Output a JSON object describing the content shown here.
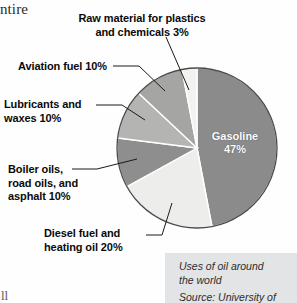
{
  "page": {
    "background": "#fefefe",
    "fragment_top_left": "ntire",
    "fragment_bottom_left": "ll"
  },
  "chart_data": {
    "type": "pie",
    "title": "Uses of oil around the world",
    "source": "Source: University of",
    "xlabel": "",
    "ylabel": "",
    "legend_position": "callout-labels",
    "grid": false,
    "categories": [
      "Gasoline",
      "Diesel fuel and heating oil",
      "Boiler oils, road oils, and asphalt",
      "Lubricants and waxes",
      "Aviation fuel",
      "Raw material for plastics and chemicals"
    ],
    "values": [
      47,
      20,
      10,
      10,
      10,
      3
    ],
    "unit": "%",
    "total": 100,
    "slices": [
      {
        "name": "Gasoline",
        "value": 47,
        "value_label": "47%",
        "label_lines": "Gasoline\n47%",
        "color": "#8b8b8b",
        "label_placement": "inside",
        "label_color": "#ffffff",
        "start_angle": 0,
        "end_angle": 169.2
      },
      {
        "name": "Diesel fuel and heating oil",
        "value": 20,
        "value_label": "20%",
        "label_lines": "Diesel fuel and\nheating oil 20%",
        "color": "#ededeb",
        "label_placement": "callout",
        "start_angle": 169.2,
        "end_angle": 241.2
      },
      {
        "name": "Boiler oils, road oils, and asphalt",
        "value": 10,
        "value_label": "10%",
        "label_lines": "Boiler oils,\nroad oils, and\nasphalt 10%",
        "color": "#8e8e8e",
        "label_placement": "callout",
        "start_angle": 241.2,
        "end_angle": 277.2
      },
      {
        "name": "Lubricants and waxes",
        "value": 10,
        "value_label": "10%",
        "label_lines": "Lubricants and\nwaxes 10%",
        "color": "#b4b4b2",
        "label_placement": "callout",
        "start_angle": 277.2,
        "end_angle": 313.2
      },
      {
        "name": "Aviation fuel",
        "value": 10,
        "value_label": "10%",
        "label_lines": "Aviation fuel 10%",
        "color": "#a5a5a3",
        "label_placement": "callout",
        "start_angle": 313.2,
        "end_angle": 349.2
      },
      {
        "name": "Raw material for plastics and chemicals",
        "value": 3,
        "value_label": "3%",
        "label_lines": "Raw material for plastics\nand chemicals 3%",
        "color": "#f2f2f0",
        "label_placement": "callout",
        "start_angle": 349.2,
        "end_angle": 360
      }
    ]
  },
  "caption": {
    "title_line_1": "Uses of oil around",
    "title_line_2": "the world",
    "source": "Source: University of",
    "background": "#e3e4e6"
  }
}
